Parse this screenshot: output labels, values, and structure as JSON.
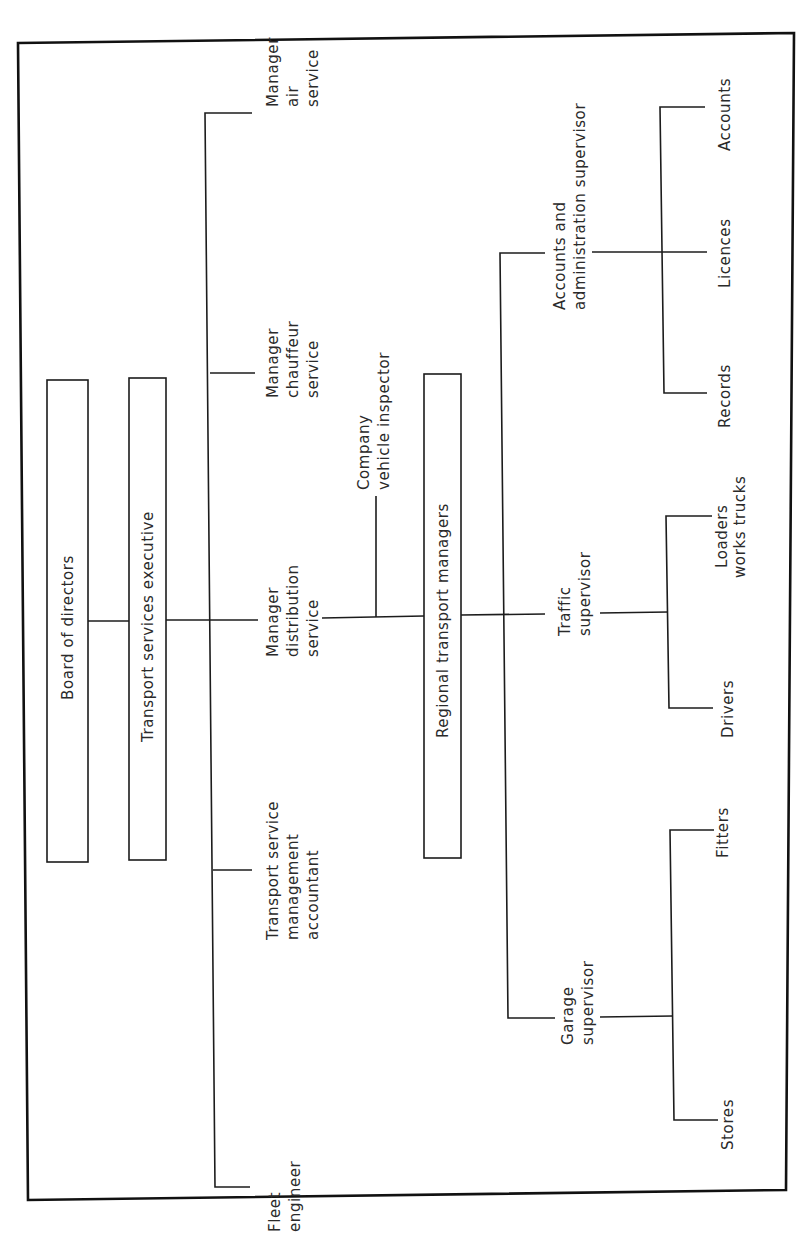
{
  "diagram": {
    "type": "organization-chart",
    "orientation": "rotated-90-ccw",
    "nodes": {
      "board": {
        "label": "Board of directors"
      },
      "executive": {
        "label": "Transport services executive"
      },
      "air": {
        "lines": [
          "Manager",
          "air",
          "service"
        ]
      },
      "chauffeur": {
        "lines": [
          "Manager",
          "chauffeur",
          "service"
        ]
      },
      "distribution": {
        "lines": [
          "Manager",
          "distribution",
          "service"
        ]
      },
      "accountant": {
        "lines": [
          "Transport service",
          "management",
          "accountant"
        ]
      },
      "fleet": {
        "lines": [
          "Fleet",
          "engineer"
        ]
      },
      "inspector": {
        "lines": [
          "Company",
          "vehicle inspector"
        ]
      },
      "regional": {
        "label": "Regional transport managers"
      },
      "accounts_admin": {
        "lines": [
          "Accounts and",
          "administration supervisor"
        ]
      },
      "traffic": {
        "lines": [
          "Traffic",
          "supervisor"
        ]
      },
      "garage": {
        "lines": [
          "Garage",
          "supervisor"
        ]
      },
      "records": {
        "label": "Records"
      },
      "licences": {
        "label": "Licences"
      },
      "accounts": {
        "label": "Accounts"
      },
      "drivers": {
        "label": "Drivers"
      },
      "loaders": {
        "lines": [
          "Loaders",
          "works trucks"
        ]
      },
      "stores": {
        "label": "Stores"
      },
      "fitters": {
        "label": "Fitters"
      }
    },
    "edges": [
      [
        "board",
        "executive"
      ],
      [
        "executive",
        "air"
      ],
      [
        "executive",
        "chauffeur"
      ],
      [
        "executive",
        "distribution"
      ],
      [
        "executive",
        "accountant"
      ],
      [
        "executive",
        "fleet"
      ],
      [
        "distribution",
        "inspector"
      ],
      [
        "distribution",
        "regional"
      ],
      [
        "regional",
        "accounts_admin"
      ],
      [
        "regional",
        "traffic"
      ],
      [
        "regional",
        "garage"
      ],
      [
        "accounts_admin",
        "records"
      ],
      [
        "accounts_admin",
        "licences"
      ],
      [
        "accounts_admin",
        "accounts"
      ],
      [
        "traffic",
        "drivers"
      ],
      [
        "traffic",
        "loaders"
      ],
      [
        "garage",
        "stores"
      ],
      [
        "garage",
        "fitters"
      ]
    ]
  }
}
